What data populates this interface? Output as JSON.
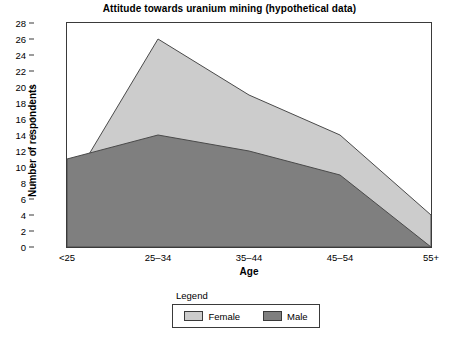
{
  "chart_data": {
    "type": "area",
    "title": "Attitude towards uranium mining (hypothetical data)",
    "xlabel": "Age",
    "ylabel": "Number of respondents",
    "categories": [
      "<25",
      "25–34",
      "35–44",
      "45–54",
      "55+"
    ],
    "series": [
      {
        "name": "Female",
        "values": [
          7,
          26,
          19,
          14,
          4
        ],
        "color": "#cccccc"
      },
      {
        "name": "Male",
        "values": [
          11,
          14,
          12,
          9,
          0
        ],
        "color": "#7f7f7f"
      }
    ],
    "ylim": [
      0,
      28
    ],
    "ytick_step": 2,
    "yticks": [
      0,
      2,
      4,
      6,
      8,
      10,
      12,
      14,
      16,
      18,
      20,
      22,
      24,
      26,
      28
    ],
    "ytick_labels": [
      "0",
      "2",
      "4",
      "6",
      "8",
      "10",
      "12",
      "14",
      "16",
      "18",
      "20",
      "22",
      "24",
      "26",
      "28"
    ],
    "grid": false,
    "legend_position": "bottom",
    "legend_title": "Legend",
    "axis_color": "#3a3a3a",
    "background": "#ffffff"
  },
  "legend": {
    "title": "Legend",
    "entries": [
      {
        "label": "Female",
        "color": "#cccccc"
      },
      {
        "label": "Male",
        "color": "#7f7f7f"
      }
    ]
  }
}
